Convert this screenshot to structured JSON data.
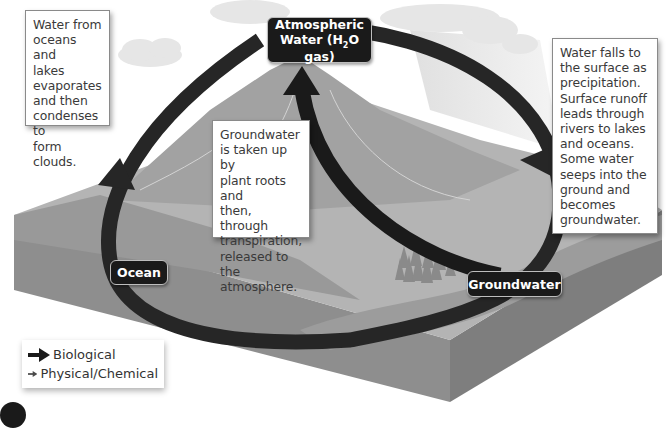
{
  "diagram": {
    "nodes": {
      "atmospheric": {
        "line1": "Atmospheric",
        "line2_pre": "Water (H",
        "line2_sub": "2",
        "line2_post": "O gas)"
      },
      "ocean": {
        "label": "Ocean"
      },
      "groundwater": {
        "label": "Groundwater"
      }
    },
    "callouts": {
      "evaporation": "Water from\noceans and\nlakes\nevaporates\nand then\ncondenses to\nform clouds.",
      "precipitation": "Water falls to\nthe surface as\nprecipitation.\nSurface runoff\nleads through\nrivers to lakes\nand oceans.\nSome water\nseeps into the\nground and\nbecomes\ngroundwater.",
      "transpiration": "Groundwater\nis taken up by\nplant roots and\nthen, through\ntranspiration,\nreleased to the\natmosphere."
    },
    "legend": {
      "items": [
        {
          "label": "Biological",
          "color": "#1a1a1a"
        },
        {
          "label": "Physical/Chemical",
          "color": "#3c3c3c"
        }
      ]
    },
    "colors": {
      "arrow_dark": "#1e1e1e",
      "arrow_physical": "#2e2e2e",
      "land_top": "#a9a9a9",
      "land_side": "#8f8f8f",
      "ocean": "#9a9a9a",
      "sky": "#ffffff"
    }
  }
}
